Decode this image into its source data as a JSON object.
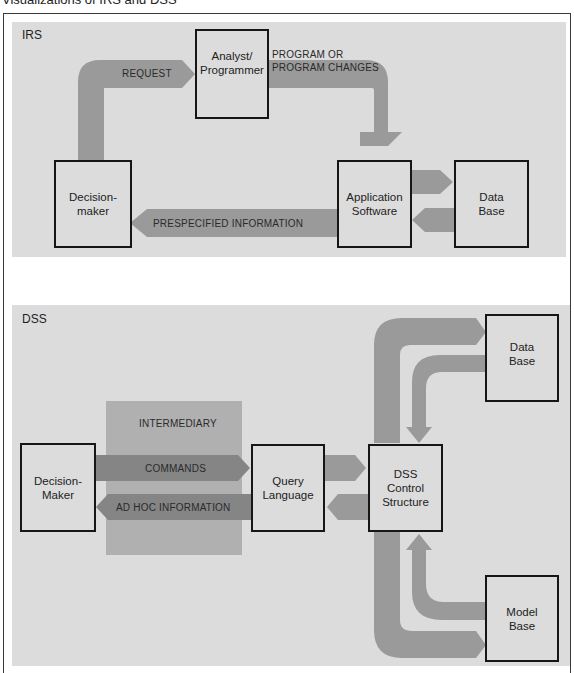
{
  "title": "Visualizations of IRS and DSS",
  "colors": {
    "panel_bg": "#dcdcdc",
    "arrow": "#9a9a9a",
    "arrow_dark": "#8a8a8a",
    "intermediary_bg": "#b0b0b0",
    "box_border": "#161616"
  },
  "irs": {
    "label": "IRS",
    "boxes": {
      "analyst": "Analyst/\nProgrammer",
      "decision_maker": "Decision-\nmaker",
      "application_software": "Application\nSoftware",
      "data_base": "Data\nBase"
    },
    "arrows": {
      "request": "REQUEST",
      "program_changes_line1": "PROGRAM OR",
      "program_changes_line2": "PROGRAM CHANGES",
      "prespecified": "PRESPECIFIED INFORMATION"
    }
  },
  "dss": {
    "label": "DSS",
    "intermediary": "INTERMEDIARY",
    "boxes": {
      "decision_maker": "Decision-\nMaker",
      "query_language": "Query\nLanguage",
      "control_structure": "DSS\nControl\nStructure",
      "data_base": "Data\nBase",
      "model_base": "Model\nBase"
    },
    "arrows": {
      "commands": "COMMANDS",
      "ad_hoc": "AD HOC INFORMATION"
    }
  }
}
